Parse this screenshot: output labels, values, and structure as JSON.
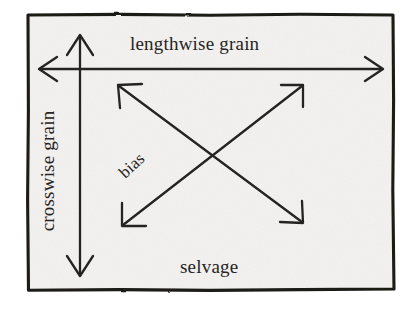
{
  "diagram": {
    "background_color": "#ffffff",
    "fabric_fill_color": "#f3f2f0",
    "ink_color": "#262422",
    "border_color": "#1c1a18",
    "labels": {
      "lengthwise": "lengthwise grain",
      "crosswise": "crosswise grain",
      "bias": "bias",
      "selvage": "selvage"
    },
    "arrows": [
      {
        "name": "lengthwise-grain-arrow",
        "label": "lengthwise grain",
        "orientation": "horizontal",
        "double_headed": true,
        "from": [
          39,
          69
        ],
        "to": [
          383,
          69
        ]
      },
      {
        "name": "crosswise-grain-arrow",
        "label": "crosswise grain",
        "orientation": "vertical",
        "double_headed": true,
        "from": [
          80,
          35
        ],
        "to": [
          80,
          276
        ]
      },
      {
        "name": "bias-arrow-nw-se",
        "label": "bias",
        "orientation": "diagonal",
        "double_headed": true,
        "from": [
          118,
          85
        ],
        "to": [
          303,
          223
        ]
      },
      {
        "name": "bias-arrow-sw-ne",
        "label": "bias",
        "orientation": "diagonal",
        "double_headed": true,
        "from": [
          122,
          226
        ],
        "to": [
          303,
          85
        ]
      }
    ],
    "fabric_rect": {
      "x": 27,
      "y": 14,
      "width": 368,
      "height": 277
    }
  }
}
